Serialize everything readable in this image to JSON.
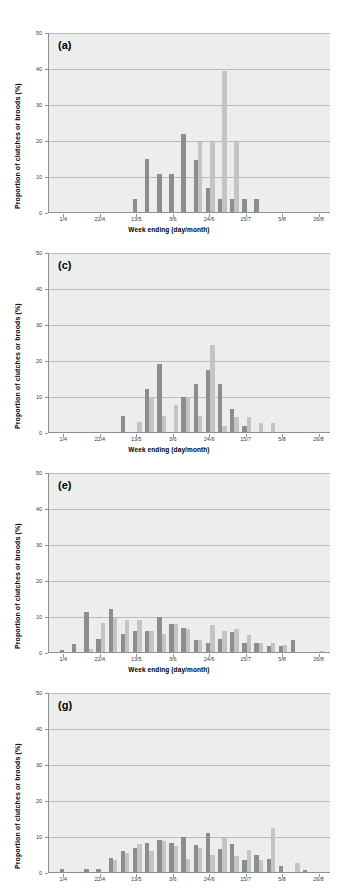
{
  "figure": {
    "axis": {
      "ylabel": "Proportion of clutches or broods (%)",
      "xlabel": "Week ending (day/month)",
      "yticks": [
        "0",
        "10",
        "20",
        "30",
        "40",
        "50"
      ],
      "xticks": [
        "1/4",
        "22/4",
        "13/5",
        "3/6",
        "24/6",
        "15/7",
        "5/8",
        "26/8"
      ]
    },
    "colors": {
      "series_dark": "#8b8d8e",
      "series_light": "#c2c4c5",
      "plot_background": "#eceded",
      "gridline": "#b9bbbc",
      "axis_line": "#8d8f90"
    },
    "panels": [
      {
        "label": "(a)"
      },
      {
        "label": "(c)"
      },
      {
        "label": "(e)"
      },
      {
        "label": "(g)"
      }
    ]
  },
  "chart_data": [
    {
      "type": "bar",
      "panel": "(a)",
      "title": "(a)",
      "xlabel": "Week ending (day/month)",
      "ylabel": "Proportion of clutches or broods (%)",
      "ylim": [
        0,
        50
      ],
      "ytick_values": [
        0,
        10,
        20,
        30,
        40,
        50
      ],
      "grid": true,
      "legend": "none",
      "x": [
        "1/4",
        "8/4",
        "15/4",
        "22/4",
        "29/4",
        "6/5",
        "13/5",
        "20/5",
        "27/5",
        "3/6",
        "10/6",
        "17/6",
        "24/6",
        "1/7",
        "8/7",
        "15/7",
        "22/7",
        "29/7",
        "5/8",
        "12/8",
        "19/8",
        "26/8"
      ],
      "xtick_labels": [
        "1/4",
        "22/4",
        "13/5",
        "3/6",
        "24/6",
        "15/7",
        "5/8",
        "26/8"
      ],
      "series": [
        {
          "name": "series-dark",
          "values": [
            0,
            0,
            0,
            0,
            0,
            0,
            3.7,
            14.6,
            10.5,
            10.5,
            21.8,
            14.5,
            6.7,
            3.6,
            3.6,
            3.6,
            3.6,
            0,
            0,
            0,
            0,
            0
          ]
        },
        {
          "name": "series-light",
          "values": [
            0,
            0,
            0,
            0,
            0,
            0,
            0,
            0,
            0,
            0,
            0,
            19.5,
            19.5,
            39.3,
            19.5,
            0,
            0,
            0,
            0,
            0,
            0,
            0
          ]
        }
      ]
    },
    {
      "type": "bar",
      "panel": "(c)",
      "title": "(c)",
      "xlabel": "Week ending (day/month)",
      "ylabel": "Proportion of clutches or broods (%)",
      "ylim": [
        0,
        50
      ],
      "ytick_values": [
        0,
        10,
        20,
        30,
        40,
        50
      ],
      "grid": true,
      "legend": "none",
      "x": [
        "1/4",
        "8/4",
        "15/4",
        "22/4",
        "29/4",
        "6/5",
        "13/5",
        "20/5",
        "27/5",
        "3/6",
        "10/6",
        "17/6",
        "24/6",
        "1/7",
        "8/7",
        "15/7",
        "22/7",
        "29/7",
        "5/8",
        "12/8",
        "19/8",
        "26/8"
      ],
      "xtick_labels": [
        "1/4",
        "22/4",
        "13/5",
        "3/6",
        "24/6",
        "15/7",
        "5/8",
        "26/8"
      ],
      "series": [
        {
          "name": "series-dark",
          "values": [
            0,
            0,
            0,
            0,
            0,
            4.5,
            0,
            12.0,
            18.8,
            0,
            9.8,
            13.4,
            17.3,
            13.4,
            6.5,
            1.8,
            0,
            0,
            0,
            0,
            0,
            0
          ]
        },
        {
          "name": "series-light",
          "values": [
            0,
            0,
            0,
            0,
            0,
            0,
            2.9,
            9.8,
            4.4,
            7.5,
            9.7,
            4.4,
            24.2,
            1.7,
            4.3,
            4.2,
            2.6,
            2.6,
            0,
            0,
            0,
            0
          ]
        }
      ]
    },
    {
      "type": "bar",
      "panel": "(e)",
      "title": "(e)",
      "xlabel": "Week ending (day/month)",
      "ylabel": "Proportion of clutches or broods (%)",
      "ylim": [
        0,
        50
      ],
      "ytick_values": [
        0,
        10,
        20,
        30,
        40,
        50
      ],
      "grid": true,
      "legend": "none",
      "x": [
        "1/4",
        "8/4",
        "15/4",
        "22/4",
        "29/4",
        "6/5",
        "13/5",
        "20/5",
        "27/5",
        "3/6",
        "10/6",
        "17/6",
        "24/6",
        "1/7",
        "8/7",
        "15/7",
        "22/7",
        "29/7",
        "5/8",
        "12/8",
        "19/8",
        "26/8"
      ],
      "xtick_labels": [
        "1/4",
        "22/4",
        "13/5",
        "3/6",
        "24/6",
        "15/7",
        "5/8",
        "26/8"
      ],
      "series": [
        {
          "name": "series-dark",
          "values": [
            0.6,
            2.1,
            11.0,
            3.6,
            12.0,
            5.0,
            5.9,
            5.9,
            9.7,
            7.9,
            6.7,
            3.4,
            2.6,
            3.5,
            5.6,
            2.5,
            2.5,
            1.6,
            1.6,
            3.2,
            0,
            0
          ]
        },
        {
          "name": "series-light",
          "values": [
            0,
            0,
            0.7,
            8.0,
            9.7,
            8.8,
            8.8,
            5.9,
            4.9,
            7.8,
            6.4,
            3.4,
            7.6,
            5.9,
            6.4,
            4.6,
            2.5,
            2.4,
            2.0,
            0,
            0,
            0.4
          ]
        }
      ]
    },
    {
      "type": "bar",
      "panel": "(g)",
      "title": "(g)",
      "xlabel": "Week ending (day/month)",
      "ylabel": "Proportion of clutches or broods (%)",
      "ylim": [
        0,
        50
      ],
      "ytick_values": [
        0,
        10,
        20,
        30,
        40,
        50
      ],
      "grid": true,
      "legend": "none",
      "x": [
        "1/4",
        "8/4",
        "15/4",
        "22/4",
        "29/4",
        "6/5",
        "13/5",
        "20/5",
        "27/5",
        "3/6",
        "10/6",
        "17/6",
        "24/6",
        "1/7",
        "8/7",
        "15/7",
        "22/7",
        "29/7",
        "5/8",
        "12/8",
        "19/8",
        "26/8"
      ],
      "xtick_labels": [
        "1/4",
        "22/4",
        "13/5",
        "3/6",
        "24/6",
        "15/7",
        "5/8",
        "26/8"
      ],
      "series": [
        {
          "name": "series-dark",
          "values": [
            0.8,
            0,
            0.9,
            0.7,
            4.0,
            5.9,
            6.8,
            8.0,
            8.8,
            8.0,
            9.7,
            7.6,
            10.7,
            6.3,
            7.7,
            3.3,
            4.7,
            3.5,
            1.7,
            0,
            0.5,
            0
          ]
        },
        {
          "name": "series-light",
          "values": [
            0,
            0,
            0,
            0,
            3.2,
            5.2,
            7.9,
            5.9,
            8.6,
            7.1,
            3.6,
            6.8,
            4.8,
            9.5,
            4.5,
            6.2,
            3.4,
            12.2,
            0,
            2.4,
            0,
            0
          ]
        }
      ]
    }
  ]
}
